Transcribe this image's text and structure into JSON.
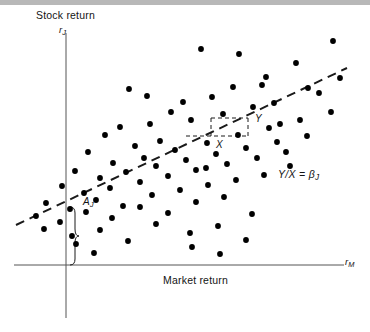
{
  "figure": {
    "type": "scatter",
    "background_color": "#ffffff",
    "top_band_color": "#b8b8b8",
    "axis_color": "#555555",
    "point_color": "#000000",
    "line_color": "#1a1a1a"
  },
  "labels": {
    "y_axis_title": "Stock return",
    "y_axis_symbol": "r",
    "y_axis_symbol_sub": "J",
    "x_axis_title": "Market return",
    "x_axis_symbol": "r",
    "x_axis_symbol_sub": "M",
    "intercept_bracket": "A",
    "intercept_bracket_sub": "J",
    "run_label": "X",
    "rise_label": "Y",
    "slope_equation": "Y/X = β",
    "slope_equation_sub": "J"
  },
  "chart_data": {
    "type": "scatter",
    "title": "",
    "xlabel": "Market return",
    "ylabel": "Stock return",
    "xlim": [
      0,
      370
    ],
    "ylim": [
      0,
      332
    ],
    "grid": false,
    "legend": null,
    "axes": {
      "x_axis_y_px": 265,
      "x_axis_x_start_px": 14,
      "x_axis_x_end_px": 344,
      "y_axis_x_px": 66,
      "y_axis_y_top_px": 33,
      "y_axis_y_bottom_px": 318
    },
    "regression_line": {
      "style": "dashed",
      "x1_px": 16,
      "y1_px": 225,
      "x2_px": 347,
      "y2_px": 68,
      "dash_pattern": "9 6"
    },
    "intercept_bracket": {
      "x_px": 73,
      "y_top_px": 207,
      "y_bottom_px": 265,
      "label": "A_J"
    },
    "slope_triangle": {
      "apex_x_px": 211,
      "apex_y_px": 118,
      "corner_x_px": 248,
      "corner_y_px": 136,
      "base_left_x_px": 186,
      "base_y_px": 136,
      "run_label": "X",
      "rise_label": "Y"
    },
    "points_px": [
      [
        239,
        54
      ],
      [
        333,
        41
      ],
      [
        129,
        89
      ],
      [
        201,
        49
      ],
      [
        233,
        87
      ],
      [
        296,
        63
      ],
      [
        212,
        97
      ],
      [
        266,
        77
      ],
      [
        147,
        96
      ],
      [
        183,
        102
      ],
      [
        171,
        112
      ],
      [
        262,
        85
      ],
      [
        120,
        127
      ],
      [
        150,
        124
      ],
      [
        105,
        135
      ],
      [
        135,
        146
      ],
      [
        160,
        141
      ],
      [
        191,
        120
      ],
      [
        223,
        114
      ],
      [
        253,
        107
      ],
      [
        274,
        103
      ],
      [
        308,
        88
      ],
      [
        319,
        93
      ],
      [
        340,
        78
      ],
      [
        88,
        152
      ],
      [
        113,
        163
      ],
      [
        144,
        158
      ],
      [
        175,
        150
      ],
      [
        207,
        143
      ],
      [
        238,
        135
      ],
      [
        269,
        128
      ],
      [
        300,
        120
      ],
      [
        331,
        112
      ],
      [
        75,
        171
      ],
      [
        100,
        178
      ],
      [
        126,
        172
      ],
      [
        156,
        166
      ],
      [
        186,
        160
      ],
      [
        216,
        154
      ],
      [
        246,
        148
      ],
      [
        277,
        142
      ],
      [
        307,
        136
      ],
      [
        62,
        186
      ],
      [
        84,
        193
      ],
      [
        110,
        188
      ],
      [
        140,
        182
      ],
      [
        168,
        176
      ],
      [
        196,
        170
      ],
      [
        227,
        164
      ],
      [
        257,
        158
      ],
      [
        286,
        152
      ],
      [
        46,
        203
      ],
      [
        70,
        209
      ],
      [
        96,
        200
      ],
      [
        123,
        206
      ],
      [
        152,
        195
      ],
      [
        180,
        190
      ],
      [
        208,
        185
      ],
      [
        236,
        180
      ],
      [
        264,
        175
      ],
      [
        36,
        216
      ],
      [
        60,
        222
      ],
      [
        86,
        212
      ],
      [
        112,
        218
      ],
      [
        140,
        207
      ],
      [
        168,
        213
      ],
      [
        196,
        202
      ],
      [
        224,
        197
      ],
      [
        252,
        214
      ],
      [
        44,
        229
      ],
      [
        72,
        236
      ],
      [
        100,
        230
      ],
      [
        128,
        241
      ],
      [
        156,
        224
      ],
      [
        190,
        233
      ],
      [
        218,
        226
      ],
      [
        246,
        240
      ],
      [
        94,
        253
      ],
      [
        192,
        247
      ],
      [
        220,
        254
      ],
      [
        76,
        244
      ],
      [
        290,
        166
      ],
      [
        206,
        168
      ],
      [
        280,
        124
      ]
    ]
  }
}
